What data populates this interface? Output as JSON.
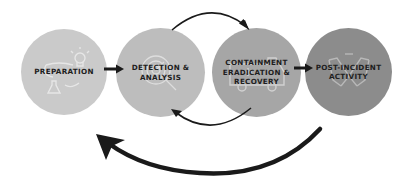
{
  "diagram": {
    "stages": [
      {
        "id": "preparation",
        "label": "PREPARATION",
        "icon": "lightbulb-flask-icon",
        "fill": "#cacaca"
      },
      {
        "id": "detection-analysis",
        "label": "DETECTION &\nANALYSIS",
        "icon": "magnifier-radar-icon",
        "fill": "#bdbdbd"
      },
      {
        "id": "containment",
        "label": "CONTAINMENT\nERADICATION &\nRECOVERY",
        "icon": "ambulance-icon",
        "fill": "#a6a6a6"
      },
      {
        "id": "post-incident",
        "label": "POST-INCIDENT\nACTIVITY",
        "icon": "handshake-icon",
        "fill": "#8c8c8c"
      }
    ],
    "arrows": [
      {
        "from": "preparation",
        "to": "detection-analysis",
        "type": "straight"
      },
      {
        "from": "detection-analysis",
        "to": "containment",
        "type": "arc-top"
      },
      {
        "from": "containment",
        "to": "detection-analysis",
        "type": "arc-bottom"
      },
      {
        "from": "containment",
        "to": "post-incident",
        "type": "straight"
      },
      {
        "from": "post-incident",
        "to": "preparation",
        "type": "large-return-arc"
      }
    ],
    "colors": {
      "arrow": "#1a1a1a",
      "background": "#ffffff",
      "icon_stroke": "#e8e8e8"
    }
  }
}
